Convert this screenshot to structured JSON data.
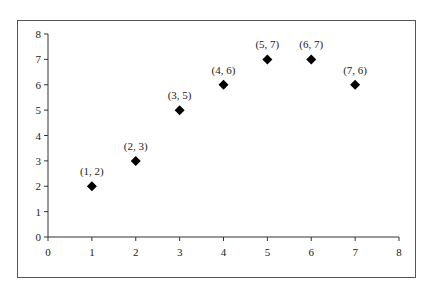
{
  "chart_data": {
    "type": "scatter",
    "title": "",
    "xlabel": "",
    "ylabel": "",
    "xlim": [
      0,
      8
    ],
    "ylim": [
      0,
      8
    ],
    "grid": false,
    "legend": null,
    "x_ticks": [
      "0",
      "1",
      "2",
      "3",
      "4",
      "5",
      "6",
      "7",
      "8"
    ],
    "y_ticks": [
      "0",
      "1",
      "2",
      "3",
      "4",
      "5",
      "6",
      "7",
      "8"
    ],
    "marker": "diamond",
    "marker_color": "#000000",
    "points": [
      {
        "x": 1,
        "y": 2,
        "label": "(1, 2)"
      },
      {
        "x": 2,
        "y": 3,
        "label": "(2, 3)"
      },
      {
        "x": 3,
        "y": 5,
        "label": "(3, 5)"
      },
      {
        "x": 4,
        "y": 6,
        "label": "(4, 6)"
      },
      {
        "x": 5,
        "y": 7,
        "label": "(5, 7)"
      },
      {
        "x": 6,
        "y": 7,
        "label": "(6, 7)"
      },
      {
        "x": 7,
        "y": 6,
        "label": "(7, 6)"
      }
    ]
  }
}
